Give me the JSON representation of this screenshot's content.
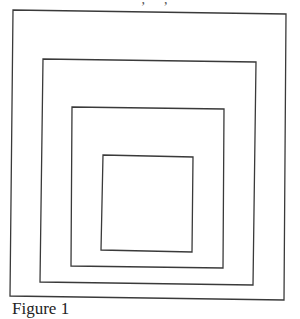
{
  "header": {
    "clipped_text": "‧ , ‧ ,"
  },
  "figure": {
    "stroke_color": "#3a3a3a",
    "background": "#ffffff",
    "squares": [
      {
        "name": "outer",
        "points": "13,10 286,14 284,300 10,296"
      },
      {
        "name": "second",
        "points": "43,59 256,62 253,285 40,282"
      },
      {
        "name": "third",
        "points": "72,107 224,109 223,268 71,266"
      },
      {
        "name": "inner",
        "points": "103,155 193,157 192,252 101,250"
      }
    ]
  },
  "caption": {
    "text": "Figure 1"
  }
}
